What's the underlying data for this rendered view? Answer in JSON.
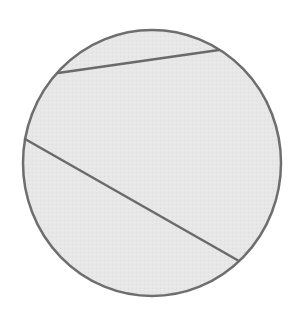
{
  "diagram": {
    "type": "circle-with-chords",
    "canvas": {
      "width": 298,
      "height": 315,
      "background": "#ffffff"
    },
    "circle": {
      "cx": 152,
      "cy": 163,
      "rx": 129,
      "ry": 133,
      "fill": "#e7e7e7",
      "stroke": "#6e6e6e",
      "stroke_width": 2.5
    },
    "chords": [
      {
        "name": "upper-chord",
        "x1": 58,
        "y1": 73,
        "x2": 219,
        "y2": 50,
        "stroke": "#6a6a6a",
        "stroke_width": 2.5
      },
      {
        "name": "lower-chord",
        "x1": 25,
        "y1": 139,
        "x2": 239,
        "y2": 261,
        "stroke": "#6a6a6a",
        "stroke_width": 2.5
      }
    ]
  }
}
